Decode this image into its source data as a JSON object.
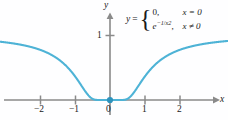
{
  "chart_data": {
    "type": "line",
    "title": "",
    "xlabel": "x",
    "ylabel": "y",
    "xlim": [
      -2.85,
      3.1
    ],
    "ylim": [
      -0.28,
      1.42
    ],
    "grid": false,
    "legend": null,
    "xticks": [
      -2,
      -1,
      0,
      1,
      2
    ],
    "xtick_labels": [
      "-2",
      "-1",
      "0",
      "1",
      "2"
    ],
    "yticks": [
      1
    ],
    "ytick_labels": [
      "1"
    ],
    "annotation": "y = { 0, x = 0 ; e^(-1/x^2), x != 0 }",
    "series": [
      {
        "name": "y = e^(-1/x^2)",
        "color": "#4eb3d6",
        "x": [
          -2.85,
          -2.6,
          -2.4,
          -2.2,
          -2.0,
          -1.8,
          -1.6,
          -1.4,
          -1.2,
          -1.0,
          -0.9,
          -0.8,
          -0.7,
          -0.6,
          -0.5,
          -0.45,
          -0.4,
          -0.35,
          -0.3,
          -0.25,
          -0.2,
          -0.1,
          0.0,
          0.1,
          0.2,
          0.25,
          0.3,
          0.35,
          0.4,
          0.45,
          0.5,
          0.6,
          0.7,
          0.8,
          0.9,
          1.0,
          1.2,
          1.4,
          1.6,
          1.8,
          2.0,
          2.2,
          2.4,
          2.6,
          2.85
        ],
        "y": [
          0.885,
          0.862,
          0.841,
          0.814,
          0.779,
          0.735,
          0.677,
          0.601,
          0.499,
          0.368,
          0.291,
          0.21,
          0.13,
          0.062,
          0.018,
          0.007,
          0.002,
          0.0003,
          2e-05,
          0.0,
          0.0,
          0.0,
          0.0,
          0.0,
          0.0,
          0.0,
          2e-05,
          0.0003,
          0.002,
          0.007,
          0.018,
          0.062,
          0.13,
          0.21,
          0.291,
          0.368,
          0.499,
          0.601,
          0.677,
          0.735,
          0.779,
          0.814,
          0.841,
          0.862,
          0.885
        ]
      }
    ],
    "markers": [
      {
        "name": "origin-point",
        "x": 0,
        "y": 0,
        "color": "#2e93bd",
        "filled": true
      }
    ]
  },
  "labels": {
    "y_axis": "y",
    "x_axis": "x",
    "y_tick_1": "1",
    "x_tick_neg2": "−2",
    "x_tick_neg1": "−1",
    "x_tick_zero": "0",
    "x_tick_pos1": "1",
    "x_tick_pos2": "2"
  },
  "formula": {
    "lhs": "y",
    "equals": "=",
    "case1_value": "0",
    "case1_comma": ",",
    "case1_condition": "x = 0",
    "case2_base": "e",
    "case2_exponent_num": "−1",
    "case2_exponent_slash": "/",
    "case2_exponent_var": "x",
    "case2_exponent_pow": "2",
    "case2_comma": ",",
    "case2_condition": "x ≠ 0"
  },
  "colors": {
    "curve": "#4eb3d6",
    "axis": "#8a8a8a",
    "point": "#2e93bd",
    "background": "#fefeff",
    "text": "#1a1a1a"
  }
}
